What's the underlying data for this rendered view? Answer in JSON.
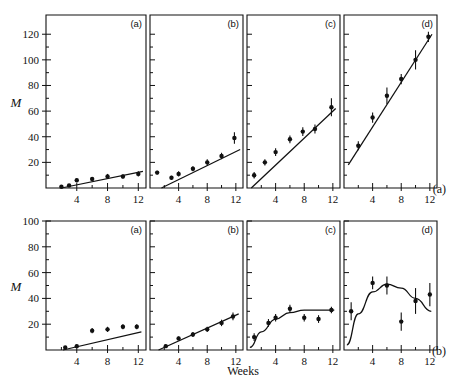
{
  "figure": {
    "ylabel": "M",
    "xlabel": "Weeks",
    "row_labels": [
      "(a)",
      "(b)"
    ],
    "panel_labels": [
      "(a)",
      "(b)",
      "(c)",
      "(d)"
    ],
    "xticks": [
      4,
      8,
      12
    ],
    "xticklabels": [
      "4",
      "8",
      "12"
    ],
    "row_a_yticks": [
      20,
      40,
      60,
      80,
      100,
      120
    ],
    "row_a_yticklabels": [
      "20",
      "40",
      "60",
      "80",
      "100",
      "120"
    ],
    "row_b_yticks": [
      20,
      40,
      60,
      80,
      100
    ],
    "row_b_yticklabels": [
      "20",
      "40",
      "60",
      "80",
      "100"
    ],
    "line_color": "#111111",
    "marker_color": "#111111"
  },
  "chart_data": [
    {
      "type": "scatter",
      "id": "row-a-panel-a",
      "row": "(a)",
      "panel": "(a)",
      "title": "",
      "xlabel": "Weeks",
      "ylabel": "M",
      "xlim": [
        0,
        13
      ],
      "ylim": [
        0,
        135
      ],
      "grid": false,
      "x": [
        2,
        3,
        4,
        6,
        8,
        10,
        12
      ],
      "y": [
        1,
        2,
        6,
        7,
        9,
        9,
        11
      ],
      "yerr": [
        0.8,
        1.0,
        1.5,
        1.5,
        2.0,
        1.5,
        2.0
      ],
      "fit": {
        "type": "line",
        "x": [
          2,
          12.6
        ],
        "y": [
          0,
          13
        ]
      }
    },
    {
      "type": "scatter",
      "id": "row-a-panel-b",
      "row": "(a)",
      "panel": "(b)",
      "title": "",
      "xlabel": "Weeks",
      "ylabel": "M",
      "xlim": [
        0,
        13
      ],
      "ylim": [
        0,
        135
      ],
      "grid": false,
      "x": [
        1,
        3,
        4,
        6,
        8,
        10,
        11.8
      ],
      "y": [
        12,
        8,
        11,
        15,
        20,
        25,
        39
      ],
      "yerr": [
        1.5,
        1.5,
        2.0,
        2.0,
        2.5,
        2.5,
        4.5
      ],
      "fit": {
        "type": "line",
        "x": [
          1.6,
          12.6
        ],
        "y": [
          0,
          30
        ]
      }
    },
    {
      "type": "scatter",
      "id": "row-a-panel-c",
      "row": "(a)",
      "panel": "(c)",
      "title": "",
      "xlabel": "Weeks",
      "ylabel": "M",
      "xlim": [
        0,
        13
      ],
      "ylim": [
        0,
        135
      ],
      "grid": false,
      "x": [
        1,
        2.5,
        4,
        6,
        7.8,
        9.5,
        11.8
      ],
      "y": [
        10,
        20,
        28,
        38,
        44,
        46,
        63
      ],
      "yerr": [
        2.5,
        2.5,
        3.0,
        3.0,
        3.5,
        3.5,
        7.0
      ],
      "fit": {
        "type": "line",
        "x": [
          0.6,
          12.4
        ],
        "y": [
          0,
          62
        ]
      }
    },
    {
      "type": "scatter",
      "id": "row-a-panel-d",
      "row": "(a)",
      "panel": "(d)",
      "title": "",
      "xlabel": "Weeks",
      "ylabel": "M",
      "xlim": [
        0,
        13
      ],
      "ylim": [
        0,
        135
      ],
      "grid": false,
      "x": [
        2,
        4,
        6,
        8,
        10,
        11.8
      ],
      "y": [
        33,
        55,
        72,
        85,
        100,
        118
      ],
      "yerr": [
        3.5,
        4.0,
        6.5,
        4.0,
        7.5,
        4.0
      ],
      "fit": {
        "type": "line",
        "x": [
          0.6,
          12.3
        ],
        "y": [
          18,
          120
        ]
      }
    },
    {
      "type": "scatter",
      "id": "row-b-panel-a",
      "row": "(b)",
      "panel": "(a)",
      "title": "",
      "xlabel": "Weeks",
      "ylabel": "M",
      "xlim": [
        0,
        13
      ],
      "ylim": [
        0,
        100
      ],
      "grid": false,
      "x": [
        2.5,
        4,
        6,
        8,
        10,
        11.8
      ],
      "y": [
        2,
        3,
        15,
        16,
        18,
        18
      ],
      "yerr": [
        0.8,
        1.2,
        2.0,
        2.0,
        2.0,
        2.0
      ],
      "fit": {
        "type": "line",
        "x": [
          2.2,
          12.4
        ],
        "y": [
          0,
          14
        ]
      }
    },
    {
      "type": "scatter",
      "id": "row-b-panel-b",
      "row": "(b)",
      "panel": "(b)",
      "title": "",
      "xlabel": "Weeks",
      "ylabel": "M",
      "xlim": [
        0,
        13
      ],
      "ylim": [
        0,
        100
      ],
      "grid": false,
      "x": [
        2.2,
        4,
        6,
        8,
        10,
        11.6
      ],
      "y": [
        3,
        9,
        12,
        16,
        21,
        26
      ],
      "yerr": [
        1.2,
        1.5,
        2.0,
        2.0,
        2.5,
        3.0
      ],
      "fit": {
        "type": "line",
        "x": [
          1.2,
          12.4
        ],
        "y": [
          0,
          28
        ]
      }
    },
    {
      "type": "scatter",
      "id": "row-b-panel-c",
      "row": "(b)",
      "panel": "(c)",
      "title": "",
      "xlabel": "Weeks",
      "ylabel": "M",
      "xlim": [
        0,
        13
      ],
      "ylim": [
        0,
        100
      ],
      "grid": false,
      "x": [
        1,
        3,
        4,
        6,
        8,
        10,
        11.8
      ],
      "y": [
        10,
        21,
        25,
        32,
        25,
        24,
        31
      ],
      "yerr": [
        3.0,
        3.0,
        3.0,
        3.0,
        3.0,
        3.0,
        2.5
      ],
      "fit": {
        "type": "curve",
        "points": [
          [
            0.4,
            2
          ],
          [
            2,
            14
          ],
          [
            4,
            24
          ],
          [
            6,
            29
          ],
          [
            8,
            31
          ],
          [
            10,
            31
          ],
          [
            12.2,
            31
          ]
        ]
      }
    },
    {
      "type": "scatter",
      "id": "row-b-panel-d",
      "row": "(b)",
      "panel": "(d)",
      "title": "",
      "xlabel": "Weeks",
      "ylabel": "M",
      "xlim": [
        0,
        13
      ],
      "ylim": [
        0,
        100
      ],
      "grid": false,
      "x": [
        1,
        4,
        6,
        8,
        10,
        12
      ],
      "y": [
        30,
        52,
        50,
        22,
        38,
        43
      ],
      "yerr": [
        7.0,
        5.0,
        7.0,
        7.0,
        10.0,
        9.0
      ],
      "fit": {
        "type": "curve",
        "points": [
          [
            0.4,
            4
          ],
          [
            2,
            28
          ],
          [
            4,
            45
          ],
          [
            6,
            51
          ],
          [
            8,
            48
          ],
          [
            10,
            40
          ],
          [
            12.2,
            30
          ]
        ]
      }
    }
  ]
}
